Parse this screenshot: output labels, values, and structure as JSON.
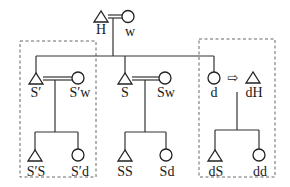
{
  "diagram": {
    "type": "kinship",
    "nodes": {
      "H": {
        "label": "H",
        "symbol": "triangle"
      },
      "w": {
        "label": "w",
        "symbol": "circle"
      },
      "S_prime": {
        "label": "S′",
        "symbol": "triangle"
      },
      "S_prime_w": {
        "label": "S′w",
        "symbol": "circle"
      },
      "S": {
        "label": "S",
        "symbol": "triangle"
      },
      "Sw": {
        "label": "Sw",
        "symbol": "circle"
      },
      "d": {
        "label": "d",
        "symbol": "circle"
      },
      "dH": {
        "label": "dH",
        "symbol": "triangle"
      },
      "S_prime_S": {
        "label": "S′S",
        "symbol": "triangle"
      },
      "S_prime_d": {
        "label": "S′d",
        "symbol": "circle"
      },
      "SS": {
        "label": "SS",
        "symbol": "triangle"
      },
      "Sd": {
        "label": "Sd",
        "symbol": "circle"
      },
      "dS": {
        "label": "dS",
        "symbol": "triangle"
      },
      "dd": {
        "label": "dd",
        "symbol": "circle"
      }
    },
    "relations": [
      {
        "type": "marriage",
        "from": "H",
        "to": "w"
      },
      {
        "type": "marriage",
        "from": "S_prime",
        "to": "S_prime_w"
      },
      {
        "type": "marriage",
        "from": "S",
        "to": "Sw"
      },
      {
        "type": "moves-to",
        "from": "d",
        "to": "dH",
        "symbol": "⇨"
      },
      {
        "type": "descent",
        "parents": [
          "H",
          "w"
        ],
        "children": [
          "S_prime",
          "S",
          "d"
        ]
      },
      {
        "type": "descent",
        "parents": [
          "S_prime",
          "S_prime_w"
        ],
        "children": [
          "S_prime_S",
          "S_prime_d"
        ]
      },
      {
        "type": "descent",
        "parents": [
          "S",
          "Sw"
        ],
        "children": [
          "SS",
          "Sd"
        ]
      },
      {
        "type": "descent",
        "parents": [
          "d",
          "dH"
        ],
        "children": [
          "dS",
          "dd"
        ]
      }
    ],
    "groups": [
      {
        "name": "left-household",
        "members": [
          "S_prime",
          "S_prime_w",
          "S_prime_S",
          "S_prime_d"
        ]
      },
      {
        "name": "right-household",
        "members": [
          "d",
          "dH",
          "dS",
          "dd"
        ]
      }
    ],
    "arrow_glyph": "⇨"
  }
}
